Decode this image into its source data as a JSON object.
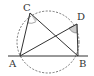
{
  "diagram": {
    "type": "geometry",
    "points": {
      "A": {
        "label": "A",
        "x": 20,
        "y": 56
      },
      "B": {
        "label": "B",
        "x": 78,
        "y": 56
      },
      "C": {
        "label": "C",
        "x": 30,
        "y": 13
      },
      "D": {
        "label": "D",
        "x": 77,
        "y": 24
      }
    },
    "segments": [
      "AC",
      "CB",
      "AD",
      "DB",
      "AB"
    ],
    "circle": {
      "style": "dashed",
      "through": [
        "A",
        "B",
        "C",
        "D"
      ]
    },
    "marked_angles": [
      "ACB",
      "ADB"
    ],
    "colors": {
      "line": "#333333",
      "angle_fill": "#cccccc"
    }
  }
}
